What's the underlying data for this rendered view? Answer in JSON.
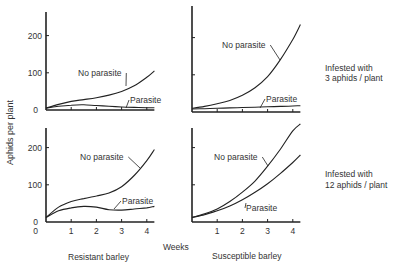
{
  "chart_data": [
    {
      "type": "line",
      "panel": "top-left",
      "title": "Resistant barley, infested with 3 aphids / plant",
      "xlabel": "Weeks",
      "ylabel": "Aphids per plant",
      "x": [
        0,
        0.5,
        1,
        1.5,
        2,
        2.5,
        3,
        3.5,
        4,
        4.3
      ],
      "xlim": [
        0,
        4.3
      ],
      "ylim": [
        0,
        260
      ],
      "yticks": [
        0,
        100,
        200
      ],
      "xticks": [
        1,
        2,
        3,
        4
      ],
      "series": [
        {
          "name": "No parasite",
          "values": [
            5,
            15,
            23,
            28,
            33,
            40,
            50,
            65,
            88,
            105
          ]
        },
        {
          "name": "Parasite",
          "values": [
            5,
            10,
            13,
            14,
            12,
            10,
            8,
            7,
            6,
            6
          ]
        }
      ]
    },
    {
      "type": "line",
      "panel": "top-right",
      "title": "Susceptible barley, infested with 3 aphids / plant",
      "xlabel": "Weeks",
      "ylabel": "Aphids per plant",
      "x": [
        0,
        0.5,
        1,
        1.5,
        2,
        2.5,
        3,
        3.5,
        4,
        4.3
      ],
      "xlim": [
        0,
        4.3
      ],
      "ylim": [
        0,
        260
      ],
      "yticks": [
        0,
        100,
        200
      ],
      "xticks": [
        1,
        2,
        3,
        4
      ],
      "series": [
        {
          "name": "No parasite",
          "values": [
            10,
            15,
            22,
            31,
            45,
            65,
            95,
            140,
            195,
            235
          ]
        },
        {
          "name": "Parasite",
          "values": [
            8,
            9,
            10,
            11,
            12,
            13,
            14,
            15,
            16,
            17
          ]
        }
      ]
    },
    {
      "type": "line",
      "panel": "bottom-left",
      "title": "Resistant barley, infested with 12 aphids / plant",
      "xlabel": "Weeks",
      "ylabel": "Aphids per plant",
      "x": [
        0,
        0.5,
        1,
        1.5,
        2,
        2.5,
        3,
        3.5,
        4,
        4.3
      ],
      "xlim": [
        0,
        4.3
      ],
      "ylim": [
        0,
        260
      ],
      "yticks": [
        0,
        100,
        200
      ],
      "xticks": [
        1,
        2,
        3,
        4
      ],
      "series": [
        {
          "name": "No parasite",
          "values": [
            12,
            40,
            55,
            63,
            70,
            78,
            95,
            125,
            165,
            195
          ]
        },
        {
          "name": "Parasite",
          "values": [
            12,
            30,
            38,
            42,
            40,
            33,
            32,
            35,
            38,
            42
          ]
        }
      ]
    },
    {
      "type": "line",
      "panel": "bottom-right",
      "title": "Susceptible barley, infested with 12 aphids / plant",
      "xlabel": "Weeks",
      "ylabel": "Aphids per plant",
      "x": [
        0,
        0.5,
        1,
        1.5,
        2,
        2.5,
        3,
        3.5,
        4,
        4.3
      ],
      "xlim": [
        0,
        4.3
      ],
      "ylim": [
        0,
        260
      ],
      "yticks": [
        0,
        100,
        200
      ],
      "xticks": [
        1,
        2,
        3,
        4
      ],
      "series": [
        {
          "name": "No parasite",
          "values": [
            12,
            22,
            35,
            55,
            80,
            110,
            150,
            195,
            245,
            280
          ]
        },
        {
          "name": "Parasite",
          "values": [
            12,
            20,
            30,
            43,
            60,
            80,
            103,
            130,
            160,
            180
          ]
        }
      ]
    }
  ],
  "labels": {
    "y_axis": "Aphids per plant",
    "x_axis": "Weeks",
    "col_left": "Resistant barley",
    "col_right": "Susceptible barley",
    "row_top": [
      "Infested with",
      "3 aphids / plant"
    ],
    "row_bottom": [
      "Infested with",
      "12 aphids / plant"
    ],
    "no_parasite": "No parasite",
    "parasite": "Parasite",
    "origin": "0",
    "ytick_100": "100",
    "ytick_200": "200",
    "xticks": [
      "1",
      "2",
      "3",
      "4"
    ]
  }
}
